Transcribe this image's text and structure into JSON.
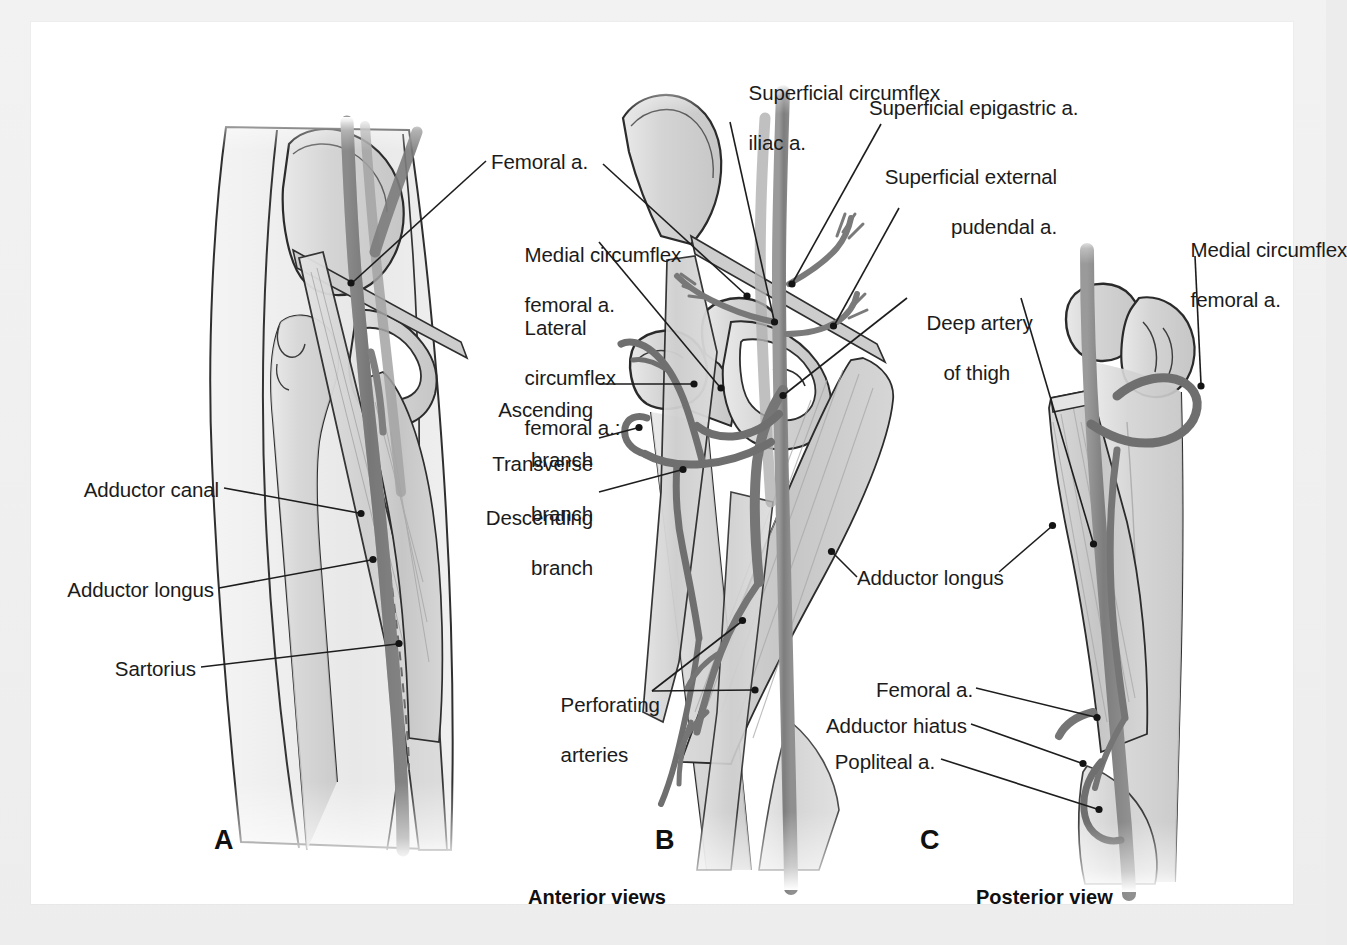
{
  "figure": {
    "background_color": "#ffffff",
    "page_color": "#ececed"
  },
  "panels": [
    {
      "id": "A",
      "letter": "A",
      "view": "Anterior views"
    },
    {
      "id": "B",
      "letter": "B",
      "view": "Anterior views"
    },
    {
      "id": "C",
      "letter": "C",
      "view": "Posterior view"
    }
  ],
  "captions": {
    "anterior": "Anterior views",
    "posterior": "Posterior view"
  },
  "labels": {
    "adductor_canal": "Adductor canal",
    "adductor_longus_a": "Adductor longus",
    "sartorius": "Sartorius",
    "femoral_a": "Femoral a.",
    "medial_circumflex_femoral_a_line1": "Medial circumflex",
    "medial_circumflex_femoral_a_line2": "femoral a.",
    "lateral_circumflex_line1": "Lateral",
    "lateral_circumflex_line2": "circumflex",
    "lateral_circumflex_line3": "femoral a.:",
    "ascending_line1": "Ascending",
    "ascending_line2": "branch",
    "transverse_line1": "Transverse",
    "transverse_line2": "branch",
    "descending_line1": "Descending",
    "descending_line2": "branch",
    "superficial_circumflex_iliac_line1": "Superficial circumflex",
    "superficial_circumflex_iliac_line2": "iliac a.",
    "superficial_epigastric": "Superficial epigastric a.",
    "superficial_external_pudendal_line1": "Superficial external",
    "superficial_external_pudendal_line2": "pudendal a.",
    "deep_artery_of_thigh_line1": "Deep artery",
    "deep_artery_of_thigh_line2": "of thigh",
    "perforating_arteries_line1": "Perforating",
    "perforating_arteries_line2": "arteries",
    "adductor_longus_b": "Adductor longus",
    "medial_circumflex_femoral_c_line1": "Medial circumflex",
    "medial_circumflex_femoral_c_line2": "femoral a.",
    "femoral_a_c": "Femoral a.",
    "adductor_hiatus": "Adductor hiatus",
    "popliteal_a": "Popliteal a."
  },
  "colors": {
    "artery": "#8b8b8b",
    "artery_dark": "#6f6f6f",
    "muscle": "#d3d3d3",
    "bone": "#d9d9d9",
    "outline": "#2a2a2a",
    "leader": "#1d1d1d",
    "text": "#1b1b1b"
  }
}
